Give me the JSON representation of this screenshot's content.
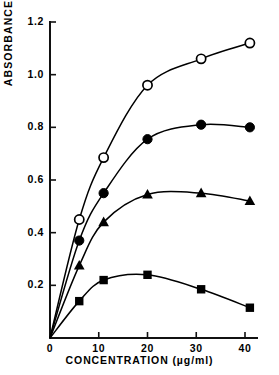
{
  "chart_data": {
    "type": "line",
    "title": "",
    "subtitle": "",
    "xlabel": "CONCENTRATION (µg/ml)",
    "ylabel": "ABSORBANCE",
    "xlim": [
      0,
      43
    ],
    "ylim": [
      0,
      1.24
    ],
    "xticks": [
      0,
      10,
      20,
      30,
      40
    ],
    "xticklabels": [
      "0",
      "10",
      "20",
      "30",
      "40"
    ],
    "yticks": [
      0.2,
      0.4,
      0.6,
      0.8,
      1.0,
      1.2
    ],
    "yticklabels": [
      "0.2",
      "0.4",
      "0.6",
      "0.8",
      "1.0",
      "1.2"
    ],
    "grid": false,
    "legend": "none",
    "marker_colors": {
      "fill": "#000000",
      "line": "#000000",
      "open_fill": "#ffffff"
    },
    "series": [
      {
        "name": "open-circle",
        "marker": "circle-open",
        "x": [
          0,
          6,
          11,
          20,
          31,
          41
        ],
        "values": [
          0.0,
          0.45,
          0.685,
          0.96,
          1.06,
          1.12
        ]
      },
      {
        "name": "filled-circle",
        "marker": "circle-filled",
        "x": [
          0,
          6,
          11,
          20,
          31,
          41
        ],
        "values": [
          0.0,
          0.37,
          0.55,
          0.755,
          0.81,
          0.8
        ]
      },
      {
        "name": "filled-triangle",
        "marker": "triangle-filled",
        "x": [
          0,
          6,
          11,
          20,
          31,
          41
        ],
        "values": [
          0.0,
          0.275,
          0.44,
          0.545,
          0.55,
          0.52
        ]
      },
      {
        "name": "filled-square",
        "marker": "square-filled",
        "x": [
          0,
          6,
          11,
          20,
          31,
          41
        ],
        "values": [
          0.0,
          0.14,
          0.22,
          0.24,
          0.185,
          0.115
        ]
      }
    ]
  }
}
